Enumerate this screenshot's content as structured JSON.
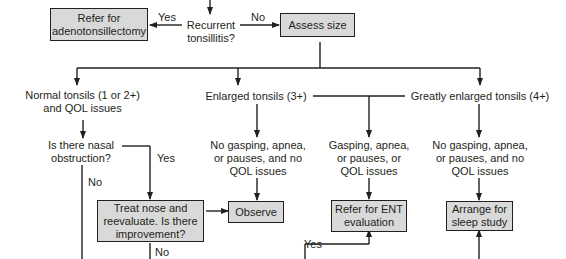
{
  "diagram": {
    "type": "flowchart",
    "nodes": {
      "refer_adeno": "Refer for\nadenotonsillectomy",
      "recurrent": "Recurrent\ntonsillitis?",
      "assess_size": "Assess size",
      "normal_tonsils": "Normal tonsils (1 or 2+)\nand QOL issues",
      "enlarged_tonsils": "Enlarged tonsils (3+)",
      "greatly_enlarged": "Greatly enlarged tonsils (4+)",
      "nasal_obstruction": "Is there nasal\nobstruction?",
      "enl_no_gasping": "No gasping, apnea,\nor pauses, and no\nQOL issues",
      "enl_gasping": "Gasping, apnea,\nor pauses, or\nQOL issues",
      "great_no_gasping": "No gasping, apnea,\nor pauses, and no\nQOL issues",
      "treat_nose": "Treat nose and\nreevaluate. Is there\nimprovement?",
      "observe": "Observe",
      "refer_ent": "Refer for ENT\nevaluation",
      "sleep_study": "Arrange for\nsleep study"
    },
    "edge_labels": {
      "recurrent_yes": "Yes",
      "recurrent_no": "No",
      "nasal_yes": "Yes",
      "nasal_no": "No",
      "treat_no": "No",
      "ent_yes": "Yes"
    },
    "colors": {
      "box_fill": "#d9d9d9",
      "line": "#231f20",
      "background": "#ffffff"
    }
  }
}
